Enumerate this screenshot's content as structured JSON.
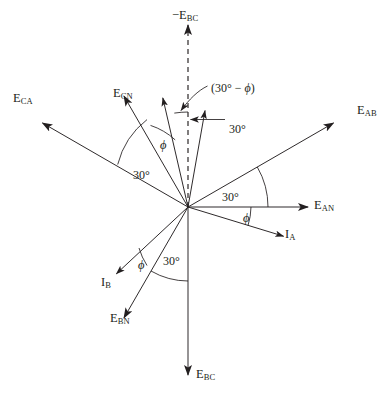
{
  "figure": {
    "kind": "three-phase-phasor-diagram",
    "width": 391,
    "height": 405,
    "background_color": "#ffffff",
    "stroke_color": "#231f20",
    "origin": {
      "x": 188,
      "y": 207
    }
  },
  "bleed_text": {
    "note": "faint cut-off text row bleeding in at top edge, illegible",
    "fragments": [
      "",
      "",
      "",
      "",
      "",
      "",
      ""
    ]
  },
  "vectors": [
    {
      "id": "minus-e-bc",
      "label_main": "−E",
      "label_sub": "BC",
      "angle_deg": 90,
      "length": 182,
      "style": "dashed",
      "arrow": true,
      "label_x": 172,
      "label_y": 9
    },
    {
      "id": "e-ab",
      "label_main": "E",
      "label_sub": "AB",
      "angle_deg": 30,
      "length": 168,
      "style": "solid",
      "arrow": true,
      "label_x": 357,
      "label_y": 104
    },
    {
      "id": "e-an",
      "label_main": "E",
      "label_sub": "AN",
      "angle_deg": 0,
      "length": 120,
      "style": "solid",
      "arrow": true,
      "label_x": 314,
      "label_y": 199
    },
    {
      "id": "i-a",
      "label_main": "I",
      "label_sub": "A",
      "angle_deg": -17,
      "length": 100,
      "style": "solid",
      "arrow": true,
      "label_x": 285,
      "label_y": 228
    },
    {
      "id": "e-ca",
      "label_main": "E",
      "label_sub": "CA",
      "angle_deg": 150,
      "length": 168,
      "style": "solid",
      "arrow": true,
      "label_x": 13,
      "label_y": 92
    },
    {
      "id": "e-cn",
      "label_main": "E",
      "label_sub": "CN",
      "angle_deg": 120,
      "length": 128,
      "style": "solid",
      "arrow": true,
      "label_x": 113,
      "label_y": 87
    },
    {
      "id": "i-c",
      "label_main": "",
      "label_sub": "",
      "angle_deg": 103,
      "length": 112,
      "style": "solid",
      "arrow": true,
      "label_x": 0,
      "label_y": 0
    },
    {
      "id": "short-vector-near-vertical",
      "label_main": "",
      "label_sub": "",
      "angle_deg": 80,
      "length": 98,
      "style": "solid",
      "arrow": true,
      "label_x": 0,
      "label_y": 0
    },
    {
      "id": "e-bc",
      "label_main": "E",
      "label_sub": "BC",
      "angle_deg": -90,
      "length": 168,
      "style": "solid",
      "arrow": true,
      "label_x": 196,
      "label_y": 368
    },
    {
      "id": "e-bn",
      "label_main": "E",
      "label_sub": "BN",
      "angle_deg": -120,
      "length": 128,
      "style": "solid",
      "arrow": true,
      "label_x": 110,
      "label_y": 312
    },
    {
      "id": "i-b",
      "label_main": "I",
      "label_sub": "B",
      "angle_deg": -137,
      "length": 98,
      "style": "solid",
      "arrow": true,
      "label_x": 101,
      "label_y": 276
    }
  ],
  "angle_labels": [
    {
      "id": "angle-30-upper-left",
      "text": "30°",
      "x": 133,
      "y": 169
    },
    {
      "id": "angle-phi-upper-left",
      "text": "ϕ",
      "x": 160,
      "y": 139
    },
    {
      "id": "angle-30-right",
      "text": "30°",
      "x": 222,
      "y": 191
    },
    {
      "id": "angle-phi-right",
      "text": "ϕ",
      "x": 243,
      "y": 212
    },
    {
      "id": "angle-30-lower-left",
      "text": "30°",
      "x": 163,
      "y": 255
    },
    {
      "id": "angle-phi-lower-left",
      "text": "ϕ",
      "x": 138,
      "y": 259
    },
    {
      "id": "angle-30-callout",
      "text": "30°",
      "x": 229,
      "y": 123
    }
  ],
  "expression_label": {
    "id": "thirty-minus-phi",
    "prefix": "(30",
    "degree": "°",
    "minus": " − ",
    "phi": "ϕ",
    "suffix": ")",
    "x": 211,
    "y": 82
  },
  "colors": {
    "ink": "#231f20",
    "paper": "#ffffff"
  }
}
